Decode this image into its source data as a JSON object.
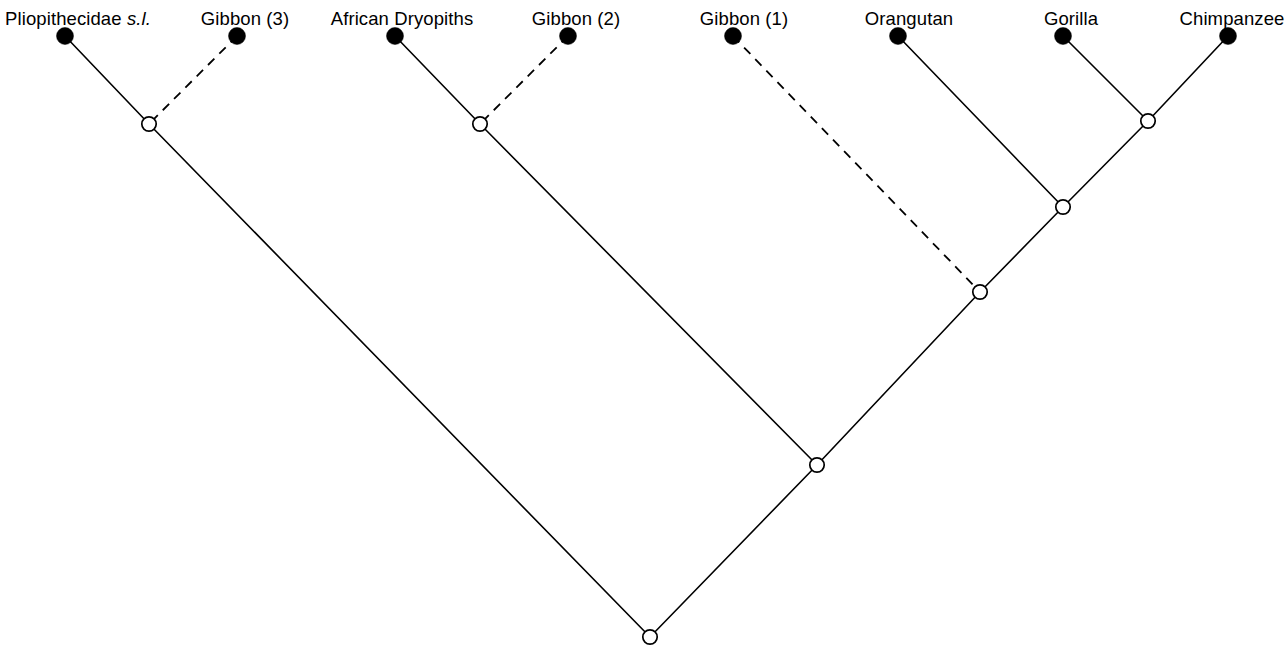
{
  "figure": {
    "kind": "cladogram",
    "orientation": "root-at-bottom",
    "width": 1286,
    "height": 655,
    "background_color": "#ffffff",
    "line_color": "#000000",
    "terminal_marker": "filled-circle",
    "internal_marker": "open-circle"
  },
  "taxa": [
    {
      "id": "pliopithecidae",
      "label": "Pliopithecidae ",
      "label_italic_suffix": "s.l.",
      "x": 65,
      "y": 36,
      "label_x": 78,
      "label_y": 8,
      "branch_style": "solid"
    },
    {
      "id": "gibbon3",
      "label": "Gibbon (3)",
      "label_italic_suffix": "",
      "x": 237,
      "y": 36,
      "label_x": 245,
      "label_y": 8,
      "branch_style": "dashed"
    },
    {
      "id": "african_dryopiths",
      "label": "African Dryopiths",
      "label_italic_suffix": "",
      "x": 395,
      "y": 36,
      "label_x": 402,
      "label_y": 8,
      "branch_style": "solid"
    },
    {
      "id": "gibbon2",
      "label": "Gibbon (2)",
      "label_italic_suffix": "",
      "x": 568,
      "y": 36,
      "label_x": 576,
      "label_y": 8,
      "branch_style": "dashed"
    },
    {
      "id": "gibbon1",
      "label": "Gibbon (1)",
      "label_italic_suffix": "",
      "x": 733,
      "y": 36,
      "label_x": 744,
      "label_y": 8,
      "branch_style": "dashed"
    },
    {
      "id": "orangutan",
      "label": "Orangutan",
      "label_italic_suffix": "",
      "x": 898,
      "y": 36,
      "label_x": 909,
      "label_y": 8,
      "branch_style": "solid"
    },
    {
      "id": "gorilla",
      "label": "Gorilla",
      "label_italic_suffix": "",
      "x": 1063,
      "y": 36,
      "label_x": 1071,
      "label_y": 8,
      "branch_style": "solid"
    },
    {
      "id": "chimpanzee",
      "label": "Chimpanzee",
      "label_italic_suffix": "",
      "x": 1228,
      "y": 36,
      "label_x": 1232,
      "label_y": 8,
      "branch_style": "solid"
    }
  ],
  "internal_nodes": [
    {
      "id": "n_pliopith_gibbon3",
      "x": 149,
      "y": 124
    },
    {
      "id": "n_dryopith_gibbon2",
      "x": 480,
      "y": 124
    },
    {
      "id": "n_gorilla_chimp",
      "x": 1148,
      "y": 121
    },
    {
      "id": "n_orang_gorilla_chimp",
      "x": 1063,
      "y": 207
    },
    {
      "id": "n_gibbon1_greatapes",
      "x": 980,
      "y": 292
    },
    {
      "id": "n_dryopith_clade",
      "x": 817,
      "y": 465
    },
    {
      "id": "n_root",
      "x": 650,
      "y": 637
    }
  ],
  "branches": [
    {
      "id": "b_pliopithecidae",
      "from": [
        65,
        36
      ],
      "to": [
        149,
        124
      ],
      "style": "solid"
    },
    {
      "id": "b_gibbon3",
      "from": [
        237,
        36
      ],
      "to": [
        149,
        124
      ],
      "style": "dashed"
    },
    {
      "id": "b_left_stem",
      "from": [
        149,
        124
      ],
      "to": [
        650,
        637
      ],
      "style": "solid"
    },
    {
      "id": "b_african_dryopiths",
      "from": [
        395,
        36
      ],
      "to": [
        480,
        124
      ],
      "style": "solid"
    },
    {
      "id": "b_gibbon2",
      "from": [
        568,
        36
      ],
      "to": [
        480,
        124
      ],
      "style": "dashed"
    },
    {
      "id": "b_dryopith_stem",
      "from": [
        480,
        124
      ],
      "to": [
        817,
        465
      ],
      "style": "solid"
    },
    {
      "id": "b_gibbon1",
      "from": [
        733,
        36
      ],
      "to": [
        980,
        292
      ],
      "style": "dashed"
    },
    {
      "id": "b_orangutan",
      "from": [
        898,
        36
      ],
      "to": [
        1063,
        207
      ],
      "style": "solid"
    },
    {
      "id": "b_gorilla",
      "from": [
        1063,
        36
      ],
      "to": [
        1148,
        121
      ],
      "style": "solid"
    },
    {
      "id": "b_chimpanzee",
      "from": [
        1228,
        36
      ],
      "to": [
        1148,
        121
      ],
      "style": "solid"
    },
    {
      "id": "b_gorilla_chimp_stem",
      "from": [
        1148,
        121
      ],
      "to": [
        1063,
        207
      ],
      "style": "solid"
    },
    {
      "id": "b_orang_clade_stem",
      "from": [
        1063,
        207
      ],
      "to": [
        980,
        292
      ],
      "style": "solid"
    },
    {
      "id": "b_greatape_stem",
      "from": [
        980,
        292
      ],
      "to": [
        817,
        465
      ],
      "style": "solid"
    },
    {
      "id": "b_right_stem",
      "from": [
        817,
        465
      ],
      "to": [
        650,
        637
      ],
      "style": "solid"
    }
  ],
  "chart_data": {
    "type": "diagram",
    "title": "",
    "subtype": "cladogram",
    "leaves": [
      "Pliopithecidae s.l.",
      "Gibbon (3)",
      "African Dryopiths",
      "Gibbon (2)",
      "Gibbon (1)",
      "Orangutan",
      "Gorilla",
      "Chimpanzee"
    ],
    "newick": "((Pliopithecidae_s.l.,Gibbon_3),((African_Dryopiths,Gibbon_2),(Gibbon_1,(Orangutan,(Gorilla,Chimpanzee)))));",
    "dashed_branches": [
      "Gibbon (3)",
      "Gibbon (2)",
      "Gibbon (1)"
    ],
    "legend": [],
    "annotations": []
  }
}
